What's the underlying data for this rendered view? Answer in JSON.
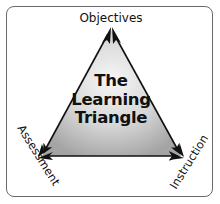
{
  "diagram": {
    "title_lines": [
      "The",
      "Learning",
      "Triangle"
    ],
    "vertices": {
      "top": "Objectives",
      "bottom_left": "Assessment",
      "bottom_right": "Instruction"
    },
    "colors": {
      "border": "#6a6a6a",
      "arrows": "#111111",
      "fill_light": "#f4f4f4",
      "fill_dark": "#a8a8a8"
    }
  }
}
